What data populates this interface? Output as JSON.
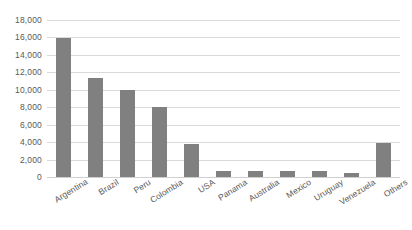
{
  "chart_data": {
    "type": "bar",
    "title": "",
    "subtitle": "",
    "xlabel": "",
    "ylabel": "",
    "categories": [
      "Argentina",
      "Brazil",
      "Peru",
      "Colombia",
      "USA",
      "Panama",
      "Australia",
      "Mexico",
      "Uruguay",
      "Venezuela",
      "Others"
    ],
    "values": [
      15900,
      11400,
      10000,
      8000,
      3800,
      700,
      700,
      700,
      700,
      500,
      3900
    ],
    "series": [
      {
        "name": "Series 1",
        "values": [
          15900,
          11400,
          10000,
          8000,
          3800,
          700,
          700,
          700,
          700,
          500,
          3900
        ]
      }
    ],
    "ylim": [
      0,
      18000
    ],
    "ytick_values": [
      0,
      2000,
      4000,
      6000,
      8000,
      10000,
      12000,
      14000,
      16000,
      18000
    ],
    "ytick_labels": [
      "0",
      "2,000",
      "4,000",
      "6,000",
      "8,000",
      "10,000",
      "12,000",
      "14,000",
      "16,000",
      "18,000"
    ],
    "grid": true,
    "grid_axis": "y",
    "legend": false,
    "legend_position": "none",
    "bar_color": "#808080",
    "gridline_color": "#d9d9d9",
    "background_color": "#ffffff",
    "axis_text_color": "#595959",
    "xlabel_rotation": -32,
    "annotations": []
  }
}
